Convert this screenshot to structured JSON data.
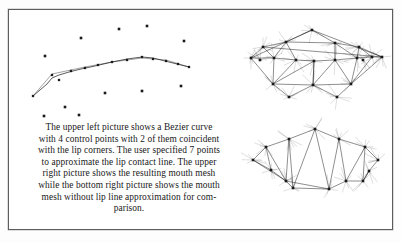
{
  "figure": {
    "background_color": "#ffffff",
    "border_color": "#5d5d5d",
    "ink_color": "#1a1a1a",
    "caption": {
      "full_text": "The upper left picture shows a Bezier curve with 4 control points with 2 of them coincident with the lip corners. The user specified 7 points to approximate the lip contact line. The upper right picture shows the resulting mouth mesh while the bottom right picture shows the mouth mesh without lip line approximation for comparison.",
      "lines": [
        "The upper left picture shows a Bezier curve",
        "with 4 control points with 2 of them coincident",
        "with the lip corners. The user specified 7 points",
        "to approximate the lip contact line. The upper",
        "right picture shows the resulting mouth mesh",
        "while the bottom right picture shows the mouth",
        "mesh without lip line approximation for com-",
        "parison."
      ]
    },
    "panels": [
      {
        "name": "upper-left-bezier-curve",
        "description": "Bezier curve with 4 control points and 7 user specified points over scattered feature points"
      },
      {
        "name": "upper-right-mouth-mesh",
        "description": "Resulting mouth mesh with lip line approximation"
      },
      {
        "name": "bottom-right-mouth-mesh",
        "description": "Mouth mesh without lip line approximation for comparison"
      }
    ]
  },
  "chart_data": [
    {
      "type": "scatter",
      "name": "upper-left-bezier-curve",
      "title": "Bezier curve with control points",
      "xlabel": "",
      "ylabel": "",
      "xlim": [
        0,
        222
      ],
      "ylim": [
        0,
        110
      ],
      "grid": false,
      "legend": "none",
      "series": [
        {
          "name": "bezier-curve-polyline",
          "type": "line",
          "points": [
            [
              14,
              82
            ],
            [
              28,
              70
            ],
            [
              33,
              64
            ],
            [
              40,
              61
            ],
            [
              50,
              58
            ],
            [
              62,
              55
            ],
            [
              76,
              52
            ],
            [
              93,
              48
            ],
            [
              108,
              45
            ],
            [
              123,
              43
            ],
            [
              134,
              44
            ],
            [
              146,
              47
            ],
            [
              158,
              50
            ],
            [
              170,
              53
            ]
          ]
        },
        {
          "name": "control-polygon",
          "type": "line",
          "points": [
            [
              14,
              82
            ],
            [
              33,
              60
            ],
            [
              66,
              53
            ],
            [
              93,
              48
            ],
            [
              123,
              44
            ],
            [
              147,
              46
            ],
            [
              170,
              53
            ]
          ]
        },
        {
          "name": "curve-sample-points",
          "type": "scatter",
          "points": [
            [
              14,
              82
            ],
            [
              33,
              61
            ],
            [
              40,
              66
            ],
            [
              52,
              57
            ],
            [
              66,
              54
            ],
            [
              79,
              51
            ],
            [
              93,
              48
            ],
            [
              108,
              46
            ],
            [
              123,
              43
            ],
            [
              134,
              45
            ],
            [
              147,
              47
            ],
            [
              159,
              50
            ],
            [
              170,
              53
            ]
          ]
        },
        {
          "name": "scattered-feature-points",
          "type": "scatter",
          "points": [
            [
              100,
              15
            ],
            [
              128,
              12
            ],
            [
              62,
              24
            ],
            [
              165,
              27
            ],
            [
              26,
              42
            ],
            [
              86,
              79
            ],
            [
              123,
              77
            ],
            [
              162,
              72
            ],
            [
              46,
              93
            ],
            [
              25,
              102
            ],
            [
              60,
              101
            ]
          ]
        }
      ]
    },
    {
      "type": "scatter",
      "name": "upper-right-mouth-mesh",
      "title": "Resulting mouth mesh",
      "xlabel": "",
      "ylabel": "",
      "xlim": [
        0,
        150
      ],
      "ylim": [
        0,
        105
      ],
      "grid": false,
      "legend": "none",
      "vertices": [
        [
          71,
          16
        ],
        [
          45,
          28
        ],
        [
          94,
          29
        ],
        [
          22,
          33
        ],
        [
          118,
          33
        ],
        [
          10,
          44
        ],
        [
          33,
          44
        ],
        [
          55,
          46
        ],
        [
          73,
          47
        ],
        [
          94,
          46
        ],
        [
          116,
          44
        ],
        [
          131,
          43
        ],
        [
          141,
          43
        ],
        [
          19,
          46
        ],
        [
          122,
          46
        ],
        [
          32,
          70
        ],
        [
          72,
          71
        ],
        [
          110,
          70
        ],
        [
          48,
          83
        ],
        [
          96,
          83
        ]
      ],
      "edges": [
        [
          3,
          1
        ],
        [
          1,
          0
        ],
        [
          0,
          2
        ],
        [
          2,
          4
        ],
        [
          3,
          5
        ],
        [
          5,
          6
        ],
        [
          6,
          7
        ],
        [
          7,
          8
        ],
        [
          8,
          9
        ],
        [
          9,
          10
        ],
        [
          10,
          11
        ],
        [
          11,
          12
        ],
        [
          1,
          6
        ],
        [
          1,
          7
        ],
        [
          2,
          9
        ],
        [
          2,
          10
        ],
        [
          4,
          10
        ],
        [
          4,
          11
        ],
        [
          6,
          15
        ],
        [
          7,
          15
        ],
        [
          8,
          15
        ],
        [
          8,
          16
        ],
        [
          9,
          16
        ],
        [
          9,
          17
        ],
        [
          10,
          17
        ],
        [
          11,
          17
        ],
        [
          15,
          16
        ],
        [
          16,
          17
        ],
        [
          8,
          16
        ],
        [
          3,
          6
        ],
        [
          5,
          15
        ],
        [
          12,
          17
        ],
        [
          15,
          18
        ],
        [
          16,
          18
        ],
        [
          16,
          19
        ],
        [
          17,
          19
        ],
        [
          1,
          2
        ],
        [
          0,
          5
        ],
        [
          0,
          12
        ],
        [
          4,
          12
        ],
        [
          3,
          12
        ]
      ]
    },
    {
      "type": "scatter",
      "name": "bottom-right-mouth-mesh",
      "title": "Mouth mesh without lip line approximation",
      "xlabel": "",
      "ylabel": "",
      "xlim": [
        0,
        150
      ],
      "ylim": [
        0,
        105
      ],
      "grid": false,
      "legend": "none",
      "vertices": [
        [
          74,
          14
        ],
        [
          48,
          24
        ],
        [
          98,
          24
        ],
        [
          25,
          32
        ],
        [
          124,
          32
        ],
        [
          12,
          45
        ],
        [
          30,
          55
        ],
        [
          137,
          45
        ],
        [
          128,
          56
        ],
        [
          45,
          66
        ],
        [
          105,
          66
        ],
        [
          122,
          66
        ],
        [
          52,
          73
        ],
        [
          88,
          74
        ]
      ],
      "edges": [
        [
          1,
          0
        ],
        [
          0,
          2
        ],
        [
          1,
          3
        ],
        [
          2,
          4
        ],
        [
          3,
          5
        ],
        [
          4,
          7
        ],
        [
          1,
          9
        ],
        [
          2,
          10
        ],
        [
          3,
          6
        ],
        [
          5,
          6
        ],
        [
          6,
          9
        ],
        [
          9,
          12
        ],
        [
          12,
          13
        ],
        [
          13,
          10
        ],
        [
          10,
          11
        ],
        [
          11,
          8
        ],
        [
          7,
          8
        ],
        [
          9,
          13
        ],
        [
          1,
          12
        ],
        [
          2,
          13
        ],
        [
          4,
          11
        ],
        [
          4,
          10
        ],
        [
          0,
          13
        ],
        [
          0,
          12
        ],
        [
          3,
          9
        ],
        [
          5,
          9
        ],
        [
          8,
          11
        ]
      ]
    }
  ]
}
